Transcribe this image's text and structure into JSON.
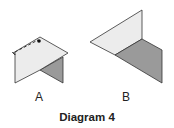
{
  "diagram": {
    "title": "Diagram 4",
    "figures": [
      {
        "id": "A",
        "label": "A",
        "description": "folded paper with dashed fold line and dot; light face over dark triangular face"
      },
      {
        "id": "B",
        "label": "B",
        "description": "folded sheet with light triangular face and dark parallelogram face"
      }
    ],
    "colors": {
      "light_face": "#ececec",
      "dark_face": "#9a9a9a",
      "stroke": "#333333"
    }
  }
}
